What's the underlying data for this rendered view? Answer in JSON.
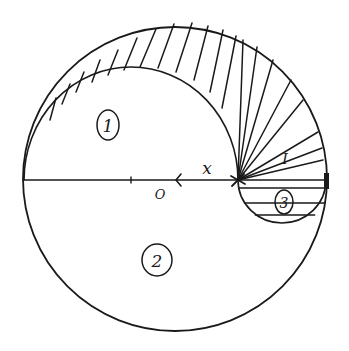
{
  "figure": {
    "type": "hand-drawn geometric diagram"
  },
  "geometry": {
    "outer_circle": {
      "cx": 175,
      "cy": 179,
      "r": 152
    },
    "diameter": {
      "x1": 23,
      "y1": 180,
      "x2": 327,
      "y2": 180
    },
    "inner_arc": {
      "x1": 24,
      "y1": 180,
      "x2": 238,
      "y2": 180,
      "rx": 107,
      "ry": 113
    },
    "small_circle": {
      "cx": 282,
      "cy": 180,
      "r": 44
    },
    "pivot": {
      "x": 238,
      "y": 180
    },
    "tick": {
      "x": 131,
      "y": 180
    },
    "arrow": {
      "x": 177,
      "y": 180,
      "direction": "left"
    },
    "right_end_marker": {
      "x": 326,
      "y": 180
    }
  },
  "hatching": {
    "upper_band_vertical": [
      [
        50,
        120,
        56,
        98
      ],
      [
        62,
        104,
        70,
        84
      ],
      [
        76,
        92,
        84,
        72
      ],
      [
        92,
        82,
        100,
        60
      ],
      [
        108,
        75,
        118,
        50
      ],
      [
        124,
        70,
        137,
        38
      ],
      [
        140,
        67,
        156,
        29
      ],
      [
        158,
        68,
        174,
        24
      ],
      [
        176,
        72,
        192,
        23
      ],
      [
        194,
        80,
        208,
        26
      ],
      [
        210,
        92,
        223,
        30
      ],
      [
        222,
        108,
        236,
        36
      ]
    ],
    "fan_rays_to": [
      [
        243,
        40
      ],
      [
        257,
        47
      ],
      [
        273,
        60
      ],
      [
        291,
        80
      ],
      [
        303,
        100
      ],
      [
        318,
        132
      ],
      [
        322,
        148
      ],
      [
        323,
        160
      ]
    ],
    "region3_horizontal_y": [
      188,
      203,
      215
    ]
  },
  "labels": {
    "region1": "1",
    "region2": "2",
    "region3": "3",
    "roman_one": "I",
    "x_label": "x",
    "origin": "O"
  },
  "label_positions": {
    "region1": {
      "x": 108,
      "y": 125,
      "rx": 11,
      "ry": 15
    },
    "region2": {
      "x": 157,
      "y": 260,
      "rx": 15,
      "ry": 16
    },
    "region3": {
      "x": 284,
      "y": 202,
      "rx": 9,
      "ry": 12
    },
    "roman_one": {
      "x": 285,
      "y": 159
    },
    "x_label": {
      "x": 207,
      "y": 168
    },
    "origin": {
      "x": 160,
      "y": 194
    }
  },
  "colors": {
    "ink": "#1a1a1a",
    "paper": "#ffffff"
  }
}
